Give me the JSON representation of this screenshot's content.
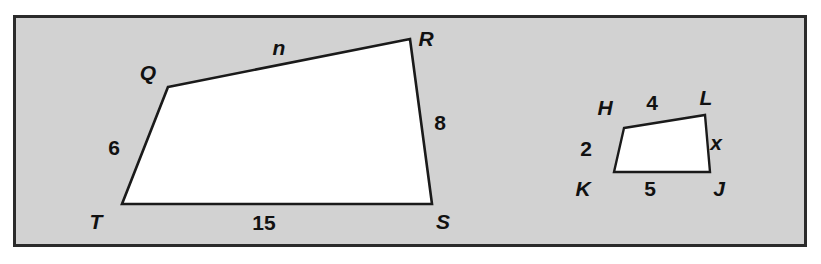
{
  "figure": {
    "type": "geometry-diagram",
    "background_color": "#ffffff",
    "panel": {
      "fill_color": "#d2d2d2",
      "border_color": "#2b2b2b",
      "x": 14,
      "y": 16,
      "width": 792,
      "height": 230
    },
    "shape_fill_color": "#ffffff",
    "shape_stroke_color": "#1a1a1a"
  },
  "shapes": [
    {
      "id": "quad-qrst",
      "name": "QRST",
      "points": "168,87 410,39 432,204 122,204",
      "vertices": [
        {
          "id": "Q",
          "label": "Q",
          "x": 168,
          "y": 87,
          "label_x": 148,
          "label_y": 80
        },
        {
          "id": "R",
          "label": "R",
          "x": 410,
          "y": 39,
          "label_x": 426,
          "label_y": 46
        },
        {
          "id": "S",
          "label": "S",
          "x": 432,
          "y": 204,
          "label_x": 443,
          "label_y": 229
        },
        {
          "id": "T",
          "label": "T",
          "x": 122,
          "y": 204,
          "label_x": 96,
          "label_y": 229
        }
      ],
      "sides": [
        {
          "id": "QR",
          "label": "n",
          "is_variable": true,
          "label_x": 279,
          "label_y": 55
        },
        {
          "id": "RS",
          "label": "8",
          "is_variable": false,
          "label_x": 440,
          "label_y": 130
        },
        {
          "id": "ST",
          "label": "15",
          "is_variable": false,
          "label_x": 264,
          "label_y": 230
        },
        {
          "id": "TQ",
          "label": "6",
          "is_variable": false,
          "label_x": 114,
          "label_y": 155
        }
      ]
    },
    {
      "id": "quad-hljk",
      "name": "HLJK",
      "points": "624,128 705,115 710,172 614,172",
      "vertices": [
        {
          "id": "H",
          "label": "H",
          "x": 624,
          "y": 128,
          "label_x": 605,
          "label_y": 115
        },
        {
          "id": "L",
          "label": "L",
          "x": 705,
          "y": 115,
          "label_x": 706,
          "label_y": 105
        },
        {
          "id": "J",
          "label": "J",
          "x": 710,
          "y": 172,
          "label_x": 719,
          "label_y": 196
        },
        {
          "id": "K",
          "label": "K",
          "x": 614,
          "y": 172,
          "label_x": 583,
          "label_y": 196
        }
      ],
      "sides": [
        {
          "id": "HL",
          "label": "4",
          "is_variable": false,
          "label_x": 652,
          "label_y": 110
        },
        {
          "id": "LJ",
          "label": "x",
          "is_variable": true,
          "label_x": 716,
          "label_y": 150
        },
        {
          "id": "JK",
          "label": "5",
          "is_variable": false,
          "label_x": 650,
          "label_y": 196
        },
        {
          "id": "KH",
          "label": "2",
          "is_variable": false,
          "label_x": 586,
          "label_y": 156
        }
      ]
    }
  ]
}
